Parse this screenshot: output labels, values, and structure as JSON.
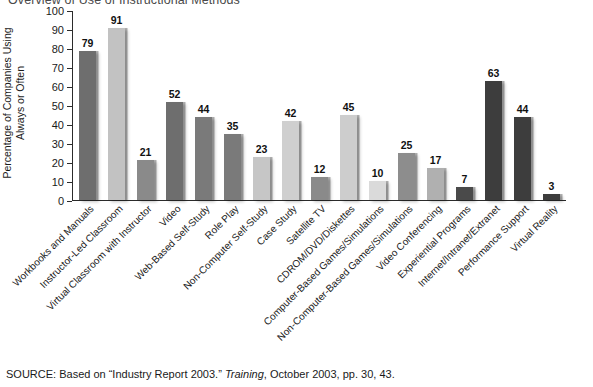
{
  "chart_data": {
    "type": "bar",
    "title": "Overview of Use of Instructional Methods",
    "xlabel": "",
    "ylabel": "Percentage of Companies Using\nAlways or Often",
    "ylim": [
      0,
      100
    ],
    "ytick_step": 10,
    "yticks": [
      100,
      90,
      80,
      70,
      60,
      50,
      40,
      30,
      20,
      10,
      0
    ],
    "grid": false,
    "legend": "none",
    "categories": [
      "Workbooks and Manuals",
      "Instructor-Led Classroom",
      "Virtual Classroom with Instructor",
      "Video",
      "Web-Based Self-Study",
      "Role Play",
      "Non-Computer Self-Study",
      "Case Study",
      "Satellite TV",
      "CDROM/DVD/Diskettes",
      "Computer-Based Games/Simulations",
      "Non-Computer-Based Games/Simulations",
      "Video Conferencing",
      "Experiential Programs",
      "Internet/Intranet/Extranet",
      "Performance Support",
      "Virtual Reality"
    ],
    "values": [
      79,
      91,
      21,
      52,
      44,
      35,
      23,
      42,
      12,
      45,
      10,
      25,
      17,
      7,
      63,
      44,
      3
    ],
    "bar_colors": [
      "#6e6e6e",
      "#c2c2c2",
      "#8a8a8a",
      "#6e6e6e",
      "#7a7a7a",
      "#7a7a7a",
      "#c6c6c6",
      "#cfcfcf",
      "#8a8a8a",
      "#cdcdcd",
      "#dadada",
      "#8d8d8d",
      "#b0b0b0",
      "#4a4a4a",
      "#3d3d3d",
      "#3d3d3d",
      "#3d3d3d"
    ]
  },
  "source": {
    "prefix": "SOURCE: Based on “Industry Report 2003.” ",
    "italic": "Training",
    "suffix": ", October 2003, pp. 30, 43."
  }
}
